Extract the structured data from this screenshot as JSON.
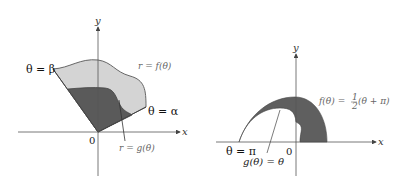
{
  "left_figure": {
    "axis_x": "x",
    "axis_y": "y",
    "origin": "0",
    "label_beta": "θ = β",
    "label_alpha": "θ = α",
    "label_f": "r = f(θ)",
    "label_g": "r = g(θ)",
    "colors": {
      "outer_fill": "#d4d4d4",
      "inner_fill": "#5a5a5a",
      "curve": "#666666"
    }
  },
  "right_figure": {
    "axis_x": "x",
    "axis_y": "y",
    "origin": "0",
    "label_pi": "θ = π",
    "label_g": "g(θ) = θ",
    "label_f_prefix": "f(θ) = ",
    "label_f_num": "1",
    "label_f_den": "2",
    "label_f_suffix": "(θ + π)",
    "colors": {
      "region_fill": "#5f5f5f"
    }
  }
}
